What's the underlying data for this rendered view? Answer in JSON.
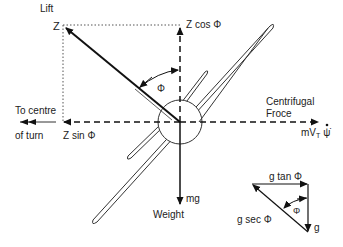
{
  "diagram": {
    "labels": {
      "lift": "Lift",
      "z": "Z",
      "z_cos_phi": "Z cos Φ",
      "phi_main": "Φ",
      "to_centre_line1": "To centre",
      "to_centre_line2": "of turn",
      "z_sin_phi": "Z sin Φ",
      "centrifugal_line1": "Centrifugal",
      "centrifugal_line2": "Froce",
      "m_v": "mV",
      "t_sub": "T",
      "psi_dot": "ψ̇",
      "mg": "mg",
      "weight": "Weight",
      "g_tan_phi": "g tan Φ",
      "g_sec_phi": "g sec Φ",
      "phi_small": "Φ",
      "g": "g"
    },
    "colors": {
      "line": "#111111",
      "text": "#222222",
      "background": "#ffffff"
    }
  }
}
